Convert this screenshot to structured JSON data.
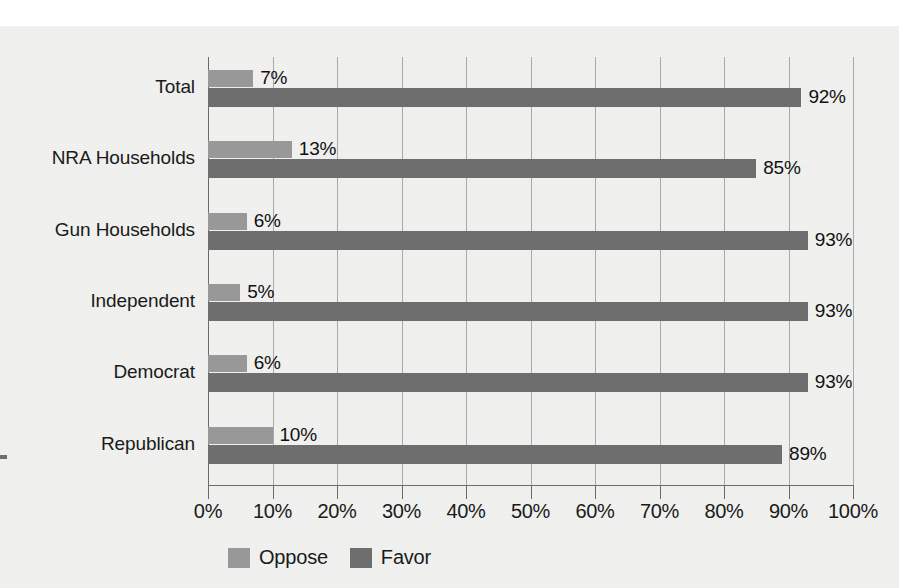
{
  "chart_data": {
    "type": "bar",
    "orientation": "horizontal",
    "grouped": true,
    "title": "",
    "subtitle": "",
    "xlabel": "",
    "ylabel": "",
    "xlim": [
      0,
      100
    ],
    "xticks": [
      "0%",
      "10%",
      "20%",
      "30%",
      "40%",
      "50%",
      "60%",
      "70%",
      "80%",
      "90%",
      "100%"
    ],
    "xtick_values": [
      0,
      10,
      20,
      30,
      40,
      50,
      60,
      70,
      80,
      90,
      100
    ],
    "grid": "vertical",
    "legend_position": "bottom",
    "categories": [
      "Total",
      "NRA Households",
      "Gun Households",
      "Independent",
      "Democrat",
      "Republican"
    ],
    "series": [
      {
        "name": "Oppose",
        "color": "#989898",
        "values": [
          7,
          13,
          6,
          5,
          6,
          10
        ],
        "labels": [
          "7%",
          "13%",
          "6%",
          "5%",
          "6%",
          "10%"
        ]
      },
      {
        "name": "Favor",
        "color": "#6e6e6e",
        "values": [
          92,
          85,
          93,
          93,
          93,
          89
        ],
        "labels": [
          "92%",
          "85%",
          "93%",
          "93%",
          "93%",
          "89%"
        ]
      }
    ]
  },
  "legend": {
    "items": [
      {
        "label": "Oppose",
        "swatch": "oppose-swatch"
      },
      {
        "label": "Favor",
        "swatch": "favor-swatch"
      }
    ]
  },
  "colors": {
    "oppose": "#989898",
    "favor": "#6e6e6e",
    "gridline": "#a9a9a9",
    "axis": "#6b6b6b",
    "background": "#f1f1ef",
    "text": "#1a1a1a"
  }
}
